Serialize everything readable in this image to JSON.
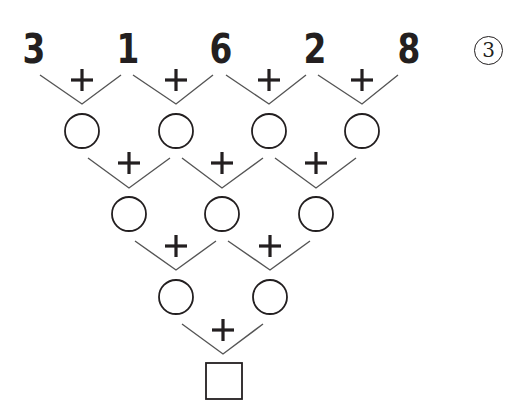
{
  "problem": {
    "label": "3",
    "top_numbers": [
      "3",
      "1",
      "6",
      "2",
      "8"
    ],
    "operator": "+",
    "rows": [
      {
        "level": 1,
        "blank_circles": 4
      },
      {
        "level": 2,
        "blank_circles": 3
      },
      {
        "level": 3,
        "blank_circles": 2
      },
      {
        "level": 4,
        "answer_box": 1
      }
    ]
  },
  "colors": {
    "ink": "#231f20",
    "line": "#555555",
    "background": "#ffffff"
  }
}
